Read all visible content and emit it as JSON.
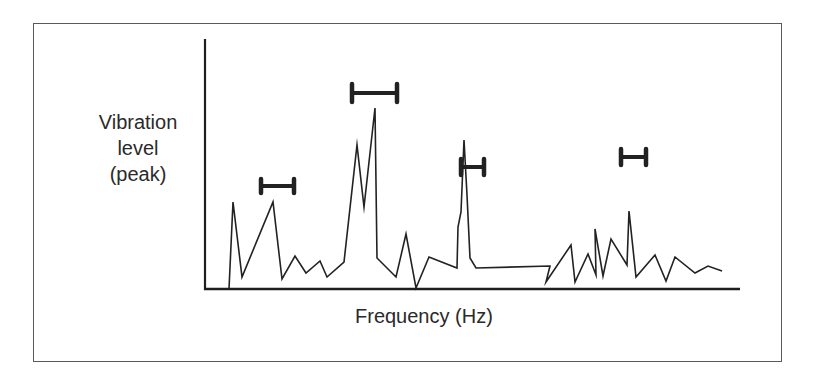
{
  "chart_data": {
    "type": "line",
    "title": "",
    "xlabel": "Frequency (Hz)",
    "ylabel": "Vibration level (peak)",
    "ylabel_lines": [
      "Vibration",
      "level",
      "(peak)"
    ],
    "grid": false,
    "legend": null,
    "ticks": {
      "x": [],
      "y": []
    },
    "axes_px": {
      "origin": [
        205,
        289
      ],
      "x_end": 740,
      "y_top": 39
    },
    "series": [
      {
        "name": "vibration spectrum",
        "color": "#222222",
        "points_px": [
          [
            229,
            289
          ],
          [
            233,
            202
          ],
          [
            242,
            277
          ],
          [
            273,
            202
          ],
          [
            282,
            279
          ],
          [
            295,
            256
          ],
          [
            306,
            273
          ],
          [
            320,
            261
          ],
          [
            327,
            277
          ],
          [
            344,
            262
          ],
          [
            357,
            145
          ],
          [
            364,
            207
          ],
          [
            375,
            108
          ],
          [
            377,
            258
          ],
          [
            396,
            277
          ],
          [
            406,
            234
          ],
          [
            416,
            288
          ],
          [
            429,
            257
          ],
          [
            457,
            268
          ],
          [
            458,
            227
          ],
          [
            461,
            212
          ],
          [
            464,
            140
          ],
          [
            467,
            195
          ],
          [
            470,
            258
          ],
          [
            476,
            268
          ],
          [
            550,
            266
          ],
          [
            546,
            282
          ],
          [
            571,
            245
          ],
          [
            575,
            282
          ],
          [
            588,
            254
          ],
          [
            596,
            275
          ],
          [
            595,
            229
          ],
          [
            603,
            276
          ],
          [
            611,
            239
          ],
          [
            627,
            265
          ],
          [
            629,
            211
          ],
          [
            636,
            277
          ],
          [
            655,
            255
          ],
          [
            666,
            281
          ],
          [
            675,
            257
          ],
          [
            695,
            273
          ],
          [
            708,
            266
          ],
          [
            722,
            271
          ]
        ]
      }
    ],
    "annotations": {
      "type": "error_bars_horizontal",
      "color": "#222222",
      "bars": [
        {
          "x1": 261,
          "x2": 294,
          "y": 186,
          "cap_half_height": 7
        },
        {
          "x1": 352,
          "x2": 397,
          "y": 93,
          "cap_half_height": 9
        },
        {
          "x1": 461,
          "x2": 484,
          "y": 167,
          "cap_half_height": 8
        },
        {
          "x1": 621,
          "x2": 646,
          "y": 157,
          "cap_half_height": 8
        }
      ]
    }
  },
  "labels": {
    "y_line1": "Vibration",
    "y_line2": "level",
    "y_line3": "(peak)",
    "x": "Frequency (Hz)"
  }
}
